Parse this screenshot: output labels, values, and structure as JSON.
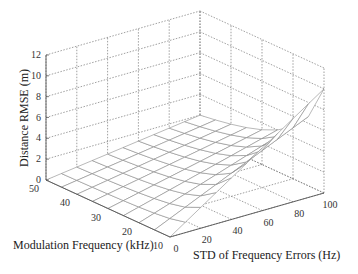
{
  "chart_data": {
    "type": "surface3d",
    "title": "",
    "xlabel": "STD of Frequency Errors (Hz)",
    "ylabel": "Modulation Frequency (kHz)",
    "zlabel": "Distance RMSE (m)",
    "x_ticks": [
      0,
      20,
      40,
      60,
      80,
      100
    ],
    "y_ticks": [
      10,
      20,
      30,
      40,
      50
    ],
    "z_ticks": [
      0,
      2,
      4,
      6,
      8,
      10,
      12
    ],
    "xlim": [
      0,
      100
    ],
    "ylim": [
      10,
      50
    ],
    "zlim": [
      0,
      12
    ],
    "grid": true,
    "surface_model": "RMSE ≈ STD / ModFreq",
    "x": [
      0,
      10,
      20,
      30,
      40,
      50,
      60,
      70,
      80,
      90,
      100
    ],
    "y": [
      10,
      15,
      20,
      25,
      30,
      35,
      40,
      45,
      50
    ],
    "samples": [
      {
        "std": 0,
        "mod": 10,
        "rmse": 0
      },
      {
        "std": 100,
        "mod": 10,
        "rmse": 10
      },
      {
        "std": 100,
        "mod": 20,
        "rmse": 5
      },
      {
        "std": 100,
        "mod": 30,
        "rmse": 3.3
      },
      {
        "std": 100,
        "mod": 50,
        "rmse": 2
      },
      {
        "std": 50,
        "mod": 10,
        "rmse": 5
      },
      {
        "std": 0,
        "mod": 50,
        "rmse": 0
      }
    ]
  },
  "labels": {
    "z_axis": "Distance RMSE (m)",
    "y_axis": "Modulation Frequency (kHz)",
    "x_axis": "STD of Frequency Errors (Hz)"
  }
}
